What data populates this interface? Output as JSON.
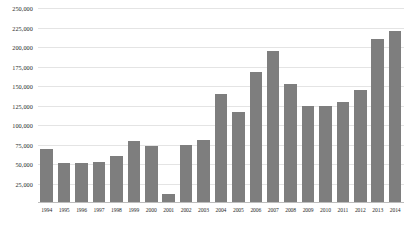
{
  "chart_data": {
    "type": "bar",
    "title": "",
    "subtitle": "",
    "xlabel": "",
    "ylabel": "",
    "ylim": [
      0,
      250000
    ],
    "ytick_step": 25000,
    "grid": true,
    "legend": null,
    "bar_color": "#7e7e7e",
    "gridline_color": "#e4e4e4",
    "axis_color": "#bdbdbd",
    "ytick_labels": [
      "250,000",
      "225,000",
      "200,000",
      "175,000",
      "150,000",
      "125,000",
      "100,000",
      "75,000",
      "50,000",
      "25,000"
    ],
    "ytick_values": [
      250000,
      225000,
      200000,
      175000,
      150000,
      125000,
      100000,
      75000,
      50000,
      25000
    ],
    "categories": [
      "1994",
      "1995",
      "1996",
      "1997",
      "1998",
      "1999",
      "2000",
      "2001",
      "2002",
      "2003",
      "2004",
      "2005",
      "2006",
      "2007",
      "2008",
      "2009",
      "2010",
      "2011",
      "2012",
      "2013",
      "2014"
    ],
    "values": [
      69000,
      51000,
      51000,
      52000,
      60000,
      80000,
      73000,
      11000,
      74000,
      81000,
      140000,
      117000,
      168000,
      195000,
      152000,
      125000,
      125000,
      130000,
      145000,
      210000,
      220000
    ]
  }
}
